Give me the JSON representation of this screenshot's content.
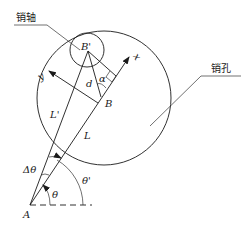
{
  "diagram": {
    "labels": {
      "pin_shaft": "销轴",
      "pin_hole": "销孔",
      "point_B_prime": "B'",
      "point_B": "B",
      "point_A": "A",
      "distance_d": "d",
      "angle_alpha": "α",
      "axis_x": "x",
      "axis_y": "y",
      "length_L_prime": "L'",
      "length_L": "L",
      "angle_delta_theta": "Δθ",
      "angle_theta": "θ",
      "angle_theta_prime": "θ'"
    },
    "colors": {
      "stroke": "#1a1a1a",
      "background": "#ffffff"
    }
  }
}
